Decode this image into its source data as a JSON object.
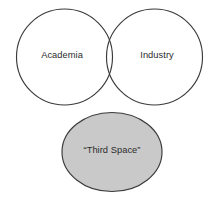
{
  "diagram": {
    "type": "venn-diagram",
    "canvas": {
      "width": 218,
      "height": 204,
      "background": "#ffffff"
    },
    "stroke_color": "#3a3a3a",
    "text_color": "#2b2b2b",
    "shapes": {
      "academia": {
        "label": "Academia",
        "shape": "circle",
        "fill": "none",
        "cx": 64.5,
        "cy": 57,
        "r": 48,
        "label_x": 62,
        "label_y": 56
      },
      "industry": {
        "label": "Industry",
        "shape": "circle",
        "fill": "none",
        "cx": 154.5,
        "cy": 57,
        "r": 48,
        "label_x": 157,
        "label_y": 56
      },
      "third_space": {
        "label": "“Third Space”",
        "shape": "ellipse",
        "fill": "#c9c9c9",
        "cx": 112,
        "cy": 152,
        "rx": 50,
        "ry": 39.5,
        "label_x": 112,
        "label_y": 151
      }
    }
  }
}
